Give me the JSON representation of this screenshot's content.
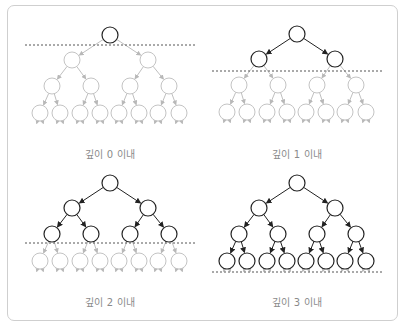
{
  "colors": {
    "active": "#222222",
    "faded": "#c4c4c4",
    "dashed": "#555555",
    "frame": "#cfcfcf",
    "label": "#8a8a8a"
  },
  "panels": [
    {
      "id": "depth0",
      "label": "깊이 0 이내",
      "depth_limit": 0,
      "cx": 110,
      "top": 35,
      "cut_y": 45,
      "label_x": 35,
      "label_y": 146
    },
    {
      "id": "depth1",
      "label": "깊이 1 이내",
      "depth_limit": 1,
      "cx": 297,
      "top": 34,
      "cut_y": 71,
      "label_x": 222,
      "label_y": 146
    },
    {
      "id": "depth2",
      "label": "깊이 2 이내",
      "depth_limit": 2,
      "cx": 110,
      "top": 183,
      "cut_y": 243,
      "label_x": 35,
      "label_y": 294
    },
    {
      "id": "depth3",
      "label": "깊이 3 이내",
      "depth_limit": 3,
      "cx": 297,
      "top": 183,
      "cut_y": 272,
      "label_x": 222,
      "label_y": 294
    }
  ],
  "tree": {
    "levels": 4,
    "node_radius": 8,
    "level_dy": [
      0,
      25,
      51,
      78
    ],
    "level_dx": [
      [
        0
      ],
      [
        -38,
        38
      ],
      [
        -58,
        -19,
        20,
        59
      ],
      [
        -70,
        -50,
        -30,
        -10,
        9,
        29,
        48,
        69
      ]
    ],
    "stub_dy": 19
  }
}
